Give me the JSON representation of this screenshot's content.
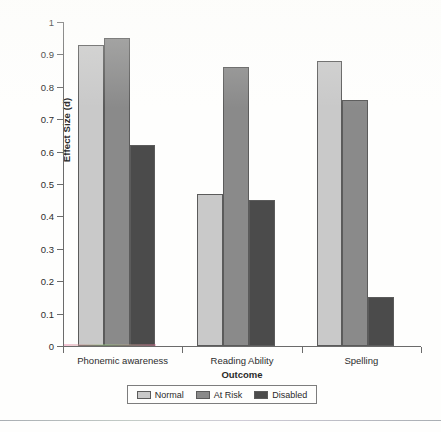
{
  "chart_data": {
    "type": "bar",
    "title": "",
    "subtitle": "",
    "xlabel": "Outcome",
    "ylabel": "Effect Size (d)",
    "categories": [
      "Phonemic awareness",
      "Reading Ability",
      "Spelling"
    ],
    "series": [
      {
        "name": "Normal",
        "color": "#c9c9c9",
        "values": [
          0.93,
          0.47,
          0.88
        ]
      },
      {
        "name": "At Risk",
        "color": "#8a8a8a",
        "values": [
          0.95,
          0.86,
          0.76
        ]
      },
      {
        "name": "Disabled",
        "color": "#4b4b4b",
        "values": [
          0.62,
          0.45,
          0.15
        ]
      }
    ],
    "ylim": [
      0,
      1
    ],
    "ytick_labels": [
      "1",
      "0.9",
      "0.8",
      "0.7",
      "0.6",
      "0.5",
      "0.4",
      "0.3",
      "0.2",
      "0.1",
      "0"
    ],
    "ytick_values": [
      1,
      0.9,
      0.8,
      0.7,
      0.6,
      0.5,
      0.4,
      0.3,
      0.2,
      0.1,
      0
    ],
    "grid": false,
    "legend_position": "bottom",
    "legend_entries": [
      "Normal",
      "At Risk",
      "Disabled"
    ]
  }
}
